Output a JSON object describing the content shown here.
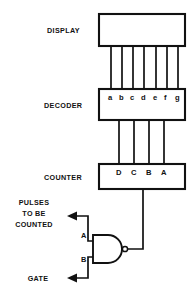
{
  "diagram": {
    "blocks": [
      {
        "key": "display",
        "label": "DISPLAY"
      },
      {
        "key": "decoder",
        "label": "DECODER"
      },
      {
        "key": "counter",
        "label": "COUNTER"
      }
    ],
    "decoder_pins": [
      "a",
      "b",
      "c",
      "d",
      "e",
      "f",
      "g"
    ],
    "counter_pins": [
      "D",
      "C",
      "B",
      "A"
    ],
    "gate": {
      "type": "nand-gate",
      "input_labels": [
        "A",
        "B"
      ]
    },
    "inputs": [
      {
        "key": "pulses",
        "lines": [
          "PULSES",
          "TO BE",
          "COUNTED"
        ]
      },
      {
        "key": "gate",
        "lines": [
          "GATE"
        ]
      }
    ],
    "bus_counts": {
      "display_to_decoder": 7,
      "decoder_to_counter": 4
    },
    "colors": {
      "ink": "#111111",
      "background": "#ffffff"
    }
  }
}
